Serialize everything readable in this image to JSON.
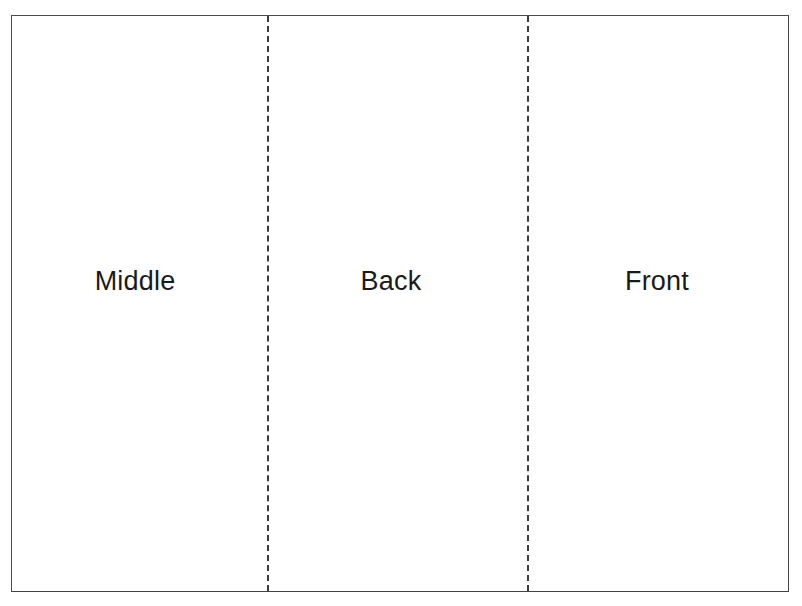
{
  "document": {
    "title": "Folded Card Panel Layout",
    "description": "Scanned line diagram of a folded card flattened out, divided by two vertical dashed fold lines into three labeled panels.",
    "background_color": "#ffffff",
    "ink_color": "#1a1a1a"
  },
  "border": {
    "name": "card-outline",
    "style": "solid",
    "color": "#4a4a4a",
    "thickness_px": 2,
    "x": 11,
    "y": 15,
    "width": 778,
    "height": 577
  },
  "fold_lines": [
    {
      "id": "fold-1",
      "label": "fold between Middle and Back",
      "orientation": "vertical",
      "style": "dashed",
      "color": "#3c3c3c",
      "x": 267,
      "dash_px": 9,
      "gap_px": 6
    },
    {
      "id": "fold-2",
      "label": "fold between Back and Front",
      "orientation": "vertical",
      "style": "dashed",
      "color": "#3c3c3c",
      "x": 527,
      "dash_px": 9,
      "gap_px": 6
    }
  ],
  "panels": [
    {
      "id": "panel-middle",
      "label": "Middle",
      "order": 1,
      "x": 11,
      "width": 256,
      "label_center_x": 133,
      "label_center_y": 281
    },
    {
      "id": "panel-back",
      "label": "Back",
      "order": 2,
      "x": 267,
      "width": 260,
      "label_center_x": 390,
      "label_center_y": 281
    },
    {
      "id": "panel-front",
      "label": "Front",
      "order": 3,
      "x": 527,
      "width": 262,
      "label_center_x": 657,
      "label_center_y": 281
    }
  ],
  "typography": {
    "label_font_size_px": 27,
    "label_weight": "normal"
  }
}
